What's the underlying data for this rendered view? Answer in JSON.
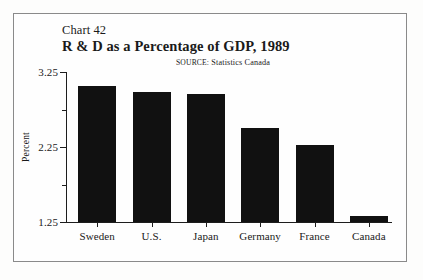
{
  "figure": {
    "chart_number": "Chart 42",
    "title": "R & D as a Percentage of GDP, 1989",
    "source_label": "SOURCE:",
    "source_value": "Statistics Canada",
    "source_full": "SOURCE: Statistics Canada",
    "frame_color": "#8a8a8a",
    "bar_color": "#111111",
    "axis_color": "#1d1d1d",
    "background": "#fefefe"
  },
  "chart_data": {
    "type": "bar",
    "title": "R & D as a Percentage of GDP, 1989",
    "subtitle": "Chart 42",
    "annotations": [
      "SOURCE: Statistics Canada"
    ],
    "categories": [
      "Sweden",
      "U.S.",
      "Japan",
      "Germany",
      "France",
      "Canada"
    ],
    "values": [
      3.06,
      2.98,
      2.96,
      2.5,
      2.28,
      1.33
    ],
    "xlabel": "",
    "ylabel": "Percent",
    "ylim": [
      1.25,
      3.25
    ],
    "yticks": [
      1.25,
      2.25,
      3.25
    ],
    "ytick_labels": [
      "1.25",
      "2.25",
      "3.25"
    ],
    "yticks_minor": [
      1.75,
      2.75
    ],
    "grid": false,
    "legend": false
  }
}
